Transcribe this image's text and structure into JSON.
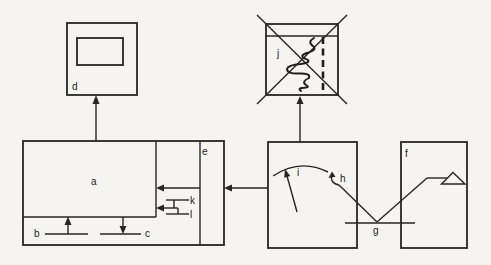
{
  "figure": {
    "type": "labeled-block-diagram",
    "background_color": "#f5f4f1",
    "line_color": "#262626",
    "label_color": "#1c1c1c",
    "labels": {
      "a": "a",
      "b": "b",
      "c": "c",
      "d": "d",
      "e": "e",
      "f": "f",
      "g": "g",
      "h": "h",
      "i": "i",
      "j": "j",
      "k": "k",
      "l": "l"
    }
  }
}
